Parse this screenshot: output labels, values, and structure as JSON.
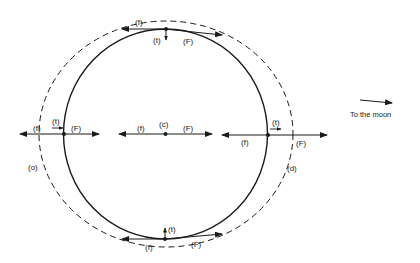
{
  "diagram": {
    "labels": {
      "f": "(f)",
      "F": "(F)",
      "t": "(t)",
      "c": "(c)",
      "o": "(o)",
      "d": "(d)"
    },
    "moon_direction": "To the moon",
    "colors": {
      "stroke": "#1a1a1a",
      "background": "#ffffff"
    },
    "points": [
      {
        "id": "top",
        "labels": [
          "(f)",
          "(t)",
          "(F)"
        ]
      },
      {
        "id": "left",
        "labels": [
          "(f)",
          "(t)",
          "(F)"
        ]
      },
      {
        "id": "center",
        "labels": [
          "(f)",
          "(c)",
          "(F)"
        ]
      },
      {
        "id": "right",
        "labels": [
          "(f)",
          "(t)",
          "(F)"
        ]
      },
      {
        "id": "bottom",
        "labels": [
          "(t)",
          "(f)",
          "(F)"
        ]
      }
    ],
    "shape_labels": [
      "(o)",
      "(d)"
    ]
  }
}
